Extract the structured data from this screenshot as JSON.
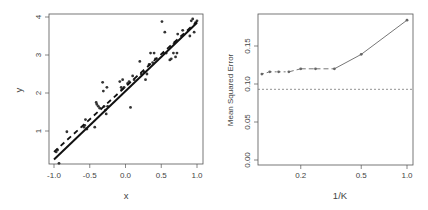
{
  "chart_data": [
    {
      "type": "scatter",
      "title": "",
      "xlabel": "x",
      "ylabel": "y",
      "xlim": [
        -1.05,
        1.05
      ],
      "ylim": [
        0.15,
        4.1
      ],
      "xticks": [
        "-1.0",
        "-0.5",
        "0.0",
        "0.5",
        "1.0"
      ],
      "yticks": [
        "1",
        "2",
        "3",
        "4"
      ],
      "grid": false,
      "points": [
        [
          -0.97,
          0.45
        ],
        [
          -0.95,
          0.5
        ],
        [
          -0.93,
          0.15
        ],
        [
          -0.82,
          0.98
        ],
        [
          -0.58,
          1.1
        ],
        [
          -0.57,
          1.15
        ],
        [
          -0.56,
          1.3
        ],
        [
          -0.54,
          1.05
        ],
        [
          -0.43,
          1.1
        ],
        [
          -0.41,
          1.75
        ],
        [
          -0.4,
          1.7
        ],
        [
          -0.38,
          1.65
        ],
        [
          -0.36,
          1.6
        ],
        [
          -0.32,
          2.28
        ],
        [
          -0.31,
          2.05
        ],
        [
          -0.3,
          1.65
        ],
        [
          -0.28,
          1.55
        ],
        [
          -0.27,
          1.45
        ],
        [
          -0.26,
          2.15
        ],
        [
          -0.25,
          1.65
        ],
        [
          -0.08,
          2.3
        ],
        [
          -0.06,
          2.15
        ],
        [
          -0.05,
          2.1
        ],
        [
          -0.04,
          2.35
        ],
        [
          -0.02,
          2.15
        ],
        [
          0.03,
          2.25
        ],
        [
          0.05,
          2.3
        ],
        [
          0.07,
          1.62
        ],
        [
          0.1,
          2.45
        ],
        [
          0.12,
          2.35
        ],
        [
          0.2,
          2.83
        ],
        [
          0.22,
          2.5
        ],
        [
          0.26,
          2.55
        ],
        [
          0.28,
          2.35
        ],
        [
          0.3,
          2.5
        ],
        [
          0.33,
          2.75
        ],
        [
          0.35,
          3.05
        ],
        [
          0.38,
          2.8
        ],
        [
          0.4,
          3.05
        ],
        [
          0.42,
          2.9
        ],
        [
          0.51,
          3.88
        ],
        [
          0.53,
          3.05
        ],
        [
          0.55,
          3.6
        ],
        [
          0.57,
          3.05
        ],
        [
          0.62,
          2.87
        ],
        [
          0.64,
          2.9
        ],
        [
          0.67,
          3.05
        ],
        [
          0.68,
          3.3
        ],
        [
          0.7,
          2.95
        ],
        [
          0.72,
          3.05
        ],
        [
          0.73,
          3.55
        ],
        [
          0.8,
          3.65
        ],
        [
          0.9,
          3.5
        ],
        [
          0.92,
          3.9
        ],
        [
          0.94,
          3.95
        ],
        [
          0.96,
          3.6
        ],
        [
          0.98,
          3.85
        ],
        [
          1.0,
          3.9
        ]
      ],
      "series": [
        {
          "name": "true linear fit",
          "style": "solid",
          "x": [
            -1.0,
            1.0
          ],
          "y": [
            0.25,
            3.85
          ]
        },
        {
          "name": "KNN fit",
          "style": "dashed",
          "x": [
            -1.0,
            1.0
          ],
          "y": [
            0.45,
            3.88
          ]
        }
      ]
    },
    {
      "type": "line",
      "title": "",
      "xlabel": "1/K",
      "ylabel": "Mean Squared Error",
      "x_scale": "log",
      "xticks": [
        "0.2",
        "0.5",
        "1.0"
      ],
      "yticks": [
        "0.00",
        "0.05",
        "0.10",
        "0.15"
      ],
      "ylim": [
        0.0,
        0.19
      ],
      "grid": false,
      "series": [
        {
          "name": "KNN test MSE",
          "style": "dashed-to-solid",
          "x": [
            0.111,
            0.125,
            0.143,
            0.167,
            0.2,
            0.25,
            0.333,
            0.5,
            1.0
          ],
          "y": [
            0.113,
            0.116,
            0.116,
            0.116,
            0.12,
            0.12,
            0.12,
            0.139,
            0.184
          ]
        },
        {
          "name": "linear regression test MSE",
          "style": "dotted",
          "y": 0.093
        }
      ]
    }
  ]
}
